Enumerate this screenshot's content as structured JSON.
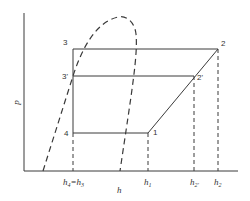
{
  "diagram": {
    "type": "p-h diagram (refrigeration cycle)",
    "axes": {
      "y_label": "p",
      "x_label": "h"
    },
    "points": [
      {
        "id": "1",
        "label": "1"
      },
      {
        "id": "2",
        "label": "2"
      },
      {
        "id": "2p",
        "label": "2'"
      },
      {
        "id": "3",
        "label": "3"
      },
      {
        "id": "3p",
        "label": "3'"
      },
      {
        "id": "4",
        "label": "4"
      }
    ],
    "x_ticks": [
      {
        "id": "h4h3",
        "main": "h",
        "sub": "4",
        "eq": "=h",
        "sub2": "3"
      },
      {
        "id": "h1",
        "main": "h",
        "sub": "1"
      },
      {
        "id": "h2p",
        "main": "h",
        "sub": "2'"
      },
      {
        "id": "h2",
        "main": "h",
        "sub": "2"
      }
    ],
    "colors": {
      "line": "#3a3a3a",
      "background": "#ffffff"
    }
  }
}
